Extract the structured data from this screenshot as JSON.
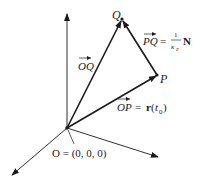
{
  "diagram": {
    "type": "3d-vector-diagram",
    "colors": {
      "ink": "#1a1a1a",
      "background": "#ffffff"
    },
    "points": {
      "origin": {
        "label": "O",
        "coords_label": "O = (0, 0, 0)"
      },
      "P": {
        "label": "P"
      },
      "Q": {
        "label": "Q"
      }
    },
    "vectors": {
      "OQ": {
        "label": "OQ"
      },
      "OP": {
        "label": "OP",
        "eq": "=",
        "rhs_func": "r",
        "rhs_arg": "t",
        "rhs_sub": "0"
      },
      "PQ": {
        "label": "PQ",
        "eq": "=",
        "num": "1",
        "den": "κ",
        "den_sub": "P",
        "rhs_vec": "N"
      }
    },
    "axes": [
      "z-axis",
      "x-axis",
      "y-axis"
    ]
  }
}
